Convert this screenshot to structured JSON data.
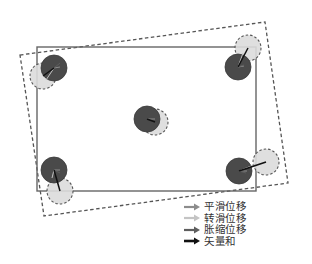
{
  "diagram": {
    "original_rect": {
      "x": 37,
      "y": 47,
      "width": 219,
      "height": 144,
      "stroke": "#666666"
    },
    "displaced_rect": {
      "points": [
        [
          20,
          55
        ],
        [
          265,
          22
        ],
        [
          288,
          183
        ],
        [
          44,
          216
        ]
      ],
      "stroke": "#555555"
    },
    "points": [
      {
        "id": "top-left",
        "original": [
          54,
          68
        ],
        "displaced": [
          43,
          76
        ],
        "r": 13,
        "vectors": {
          "translation": [
            54,
            68,
            60,
            67
          ],
          "rotation": [
            54,
            68,
            46,
            80
          ],
          "expansion": [
            54,
            68,
            60,
            63
          ],
          "resultant": [
            54,
            68,
            43,
            76
          ]
        }
      },
      {
        "id": "top-right",
        "original": [
          238,
          67
        ],
        "displaced": [
          248,
          48
        ],
        "r": 13,
        "vectors": {
          "translation": [
            238,
            67,
            244,
            66
          ],
          "rotation": [
            238,
            67,
            243,
            53
          ],
          "expansion": [
            238,
            67,
            244,
            65
          ],
          "resultant": [
            238,
            67,
            248,
            48
          ]
        }
      },
      {
        "id": "center",
        "original": [
          147,
          119
        ],
        "displaced": [
          155,
          122
        ],
        "r": 13,
        "vectors": {
          "translation": [
            147,
            119,
            155,
            119
          ],
          "rotation": [
            147,
            119,
            147,
            119
          ],
          "expansion": [
            147,
            119,
            147,
            119
          ],
          "resultant": [
            147,
            119,
            155,
            122
          ]
        }
      },
      {
        "id": "bottom-left",
        "original": [
          54,
          170
        ],
        "displaced": [
          60,
          191
        ],
        "r": 13,
        "vectors": {
          "translation": [
            54,
            170,
            60,
            170
          ],
          "rotation": [
            54,
            170,
            52,
            178
          ],
          "expansion": [
            54,
            170,
            60,
            173
          ],
          "resultant": [
            54,
            170,
            60,
            191
          ]
        }
      },
      {
        "id": "bottom-right",
        "original": [
          239,
          171
        ],
        "displaced": [
          266,
          162
        ],
        "r": 13,
        "vectors": {
          "translation": [
            239,
            171,
            247,
            171
          ],
          "rotation": [
            239,
            171,
            256,
            164
          ],
          "expansion": [
            239,
            171,
            246,
            173
          ],
          "resultant": [
            239,
            171,
            266,
            162
          ]
        }
      }
    ],
    "colors": {
      "original_circle_fill": "#4a4a4a",
      "displaced_circle_fill": "#dcdcdc",
      "displaced_circle_stroke": "#555555"
    }
  },
  "legend": {
    "items": [
      {
        "label": "平滑位移",
        "color": "#8c8c8c",
        "icon": "arrow-right-icon"
      },
      {
        "label": "转滑位移",
        "color": "#c4c4c4",
        "icon": "arrow-right-icon"
      },
      {
        "label": "胀缩位移",
        "color": "#5e5e5e",
        "icon": "arrow-right-icon"
      },
      {
        "label": "矢量和",
        "color": "#111111",
        "icon": "arrow-right-icon"
      }
    ]
  }
}
